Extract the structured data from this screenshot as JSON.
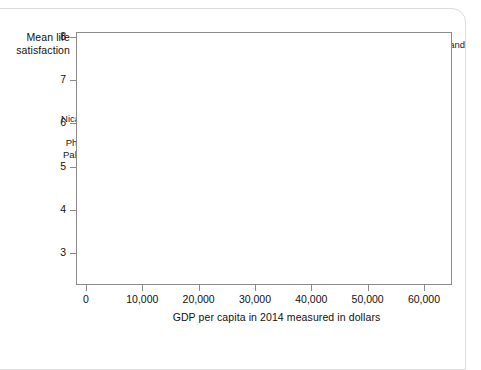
{
  "figure": {
    "y_axis_title_line1": "Mean life",
    "y_axis_title_line2": "satisfaction",
    "x_axis_title": "GDP per capita in 2014 measured in dollars"
  },
  "chart_data": {
    "type": "scatter",
    "title": "",
    "xlabel": "GDP per capita in 2014 measured in dollars",
    "ylabel": "Mean life satisfaction",
    "xlim": [
      0,
      62000
    ],
    "ylim": [
      2.6,
      8.0
    ],
    "grid": false,
    "legend": "none",
    "bubble_size_encodes": "population",
    "bubble_color": "#a6a6a6",
    "axis_color": "#8b8b8b",
    "x_ticks": [
      {
        "value": 0,
        "label": "0"
      },
      {
        "value": 10000,
        "label": "10,000"
      },
      {
        "value": 20000,
        "label": "20,000"
      },
      {
        "value": 30000,
        "label": "30,000"
      },
      {
        "value": 40000,
        "label": "40,000"
      },
      {
        "value": 50000,
        "label": "50,000"
      },
      {
        "value": 60000,
        "label": "60,000"
      }
    ],
    "y_ticks": [
      {
        "value": 3,
        "label": "3"
      },
      {
        "value": 4,
        "label": "4"
      },
      {
        "value": 5,
        "label": "5"
      },
      {
        "value": 6,
        "label": "6"
      },
      {
        "value": 7,
        "label": "7"
      },
      {
        "value": 8,
        "label": "8"
      }
    ],
    "points": [
      {
        "name": "Switzerland",
        "x": 57500,
        "y": 7.5,
        "r": 3.0,
        "labeled": true,
        "label_dx": 6,
        "label_dy": -14
      },
      {
        "name": "Canada",
        "x": 43500,
        "y": 7.3,
        "r": 6.0,
        "labeled": true,
        "label_dx": -9,
        "label_dy": -17
      },
      {
        "name": "Netherlands",
        "x": 47500,
        "y": 7.35,
        "r": 4.5,
        "labeled": true,
        "label_dx": 2,
        "label_dy": -14
      },
      {
        "name": "Finland",
        "x": 40500,
        "y": 7.4,
        "r": 3.0,
        "labeled": true,
        "label_dx": -16,
        "label_dy": -13
      },
      {
        "name": "New Zealand",
        "x": 35500,
        "y": 7.3,
        "r": 3.0,
        "labeled": true,
        "label_dx": -58,
        "label_dy": -5
      },
      {
        "name": "Israel",
        "x": 33800,
        "y": 7.1,
        "r": 3.2,
        "labeled": true,
        "label_dx": -33,
        "label_dy": 1
      },
      {
        "name": "Brazil",
        "x": 15700,
        "y": 6.95,
        "r": 10.0,
        "labeled": true,
        "label_dx": -8,
        "label_dy": -19
      },
      {
        "name": "Mexico",
        "x": 17300,
        "y": 6.8,
        "r": 9.0,
        "labeled": true,
        "label_dx": 1,
        "label_dy": -14
      },
      {
        "name": "USA",
        "x": 52500,
        "y": 7.0,
        "r": 15.0,
        "labeled": true,
        "label_dx": 9,
        "label_dy": 11
      },
      {
        "name": "UK",
        "x": 40500,
        "y": 6.9,
        "r": 8.0,
        "labeled": true,
        "label_dx": -25,
        "label_dy": -7
      },
      {
        "name": "Chile",
        "x": 22500,
        "y": 6.7,
        "r": 5.0,
        "labeled": true,
        "label_dx": 3,
        "label_dy": -11
      },
      {
        "name": "Colombia",
        "x": 13200,
        "y": 6.55,
        "r": 6.5,
        "labeled": true,
        "label_dx": -46,
        "label_dy": -6
      },
      {
        "name": "Argentina",
        "x": 22000,
        "y": 6.5,
        "r": 6.0,
        "labeled": true,
        "label_dx": -4,
        "label_dy": -2
      },
      {
        "name": "Spain",
        "x": 32500,
        "y": 6.4,
        "r": 6.5,
        "labeled": true,
        "label_dx": -6,
        "label_dy": -11
      },
      {
        "name": "Guatemala",
        "x": 7300,
        "y": 6.45,
        "r": 3.5,
        "labeled": true,
        "label_dx": -48,
        "label_dy": -7
      },
      {
        "name": "Thailand",
        "x": 15000,
        "y": 6.3,
        "r": 7.0,
        "labeled": true,
        "label_dx": -15,
        "label_dy": 1
      },
      {
        "name": "Malaysia",
        "x": 24000,
        "y": 6.3,
        "r": 5.0,
        "labeled": true,
        "label_dx": -9,
        "label_dy": 3
      },
      {
        "name": "Algeria",
        "x": 13600,
        "y": 6.1,
        "r": 4.5,
        "labeled": true,
        "label_dx": -30,
        "label_dy": 1
      },
      {
        "name": "Nicaragua",
        "x": 4800,
        "y": 6.1,
        "r": 3.0,
        "labeled": true,
        "label_dx": -52,
        "label_dy": 0
      },
      {
        "name": "France",
        "x": 37800,
        "y": 6.45,
        "r": 8.0,
        "labeled": true,
        "label_dx": -11,
        "label_dy": 12
      },
      {
        "name": "Taiwan",
        "x": 42500,
        "y": 6.35,
        "r": 6.0,
        "labeled": true,
        "label_dx": -6,
        "label_dy": 12
      },
      {
        "name": "Saudi Arabia",
        "x": 46500,
        "y": 6.4,
        "r": 5.0,
        "labeled": true,
        "label_dx": 8,
        "label_dy": 5
      },
      {
        "name": "Japan",
        "x": 36500,
        "y": 5.9,
        "r": 10.0,
        "labeled": true,
        "label_dx": -10,
        "label_dy": 16
      },
      {
        "name": "Philippines",
        "x": 6700,
        "y": 5.5,
        "r": 7.0,
        "labeled": true,
        "label_dx": -58,
        "label_dy": -2
      },
      {
        "name": "Pakistan",
        "x": 4800,
        "y": 5.3,
        "r": 7.5,
        "labeled": true,
        "label_dx": -50,
        "label_dy": 1
      },
      {
        "name": "Turkey",
        "x": 19300,
        "y": 5.3,
        "r": 7.0,
        "labeled": true,
        "label_dx": -9,
        "label_dy": 11
      },
      {
        "name": "China",
        "x": 13000,
        "y": 5.1,
        "r": 26.0,
        "labeled": true,
        "label_dx": 7,
        "label_dy": 24
      },
      {
        "name": "Greece",
        "x": 25500,
        "y": 5.0,
        "r": 3.0,
        "labeled": true,
        "label_dx": -7,
        "label_dy": 12
      },
      {
        "name": "Portugal",
        "x": 27500,
        "y": 5.05,
        "r": 3.0,
        "labeled": true,
        "label_dx": 9,
        "label_dy": 15
      },
      {
        "name": "Bulgaria",
        "x": 17500,
        "y": 4.3,
        "r": 2.5,
        "labeled": true,
        "label_dx": 6,
        "label_dy": -1
      },
      {
        "name": "Botswana",
        "x": 16500,
        "y": 4.1,
        "r": 2.5,
        "labeled": true,
        "label_dx": 4,
        "label_dy": 6
      },
      {
        "name": "Angola",
        "x": 7400,
        "y": 3.9,
        "r": 4.0,
        "labeled": true,
        "label_dx": 5,
        "label_dy": 4
      },
      {
        "name": "India",
        "x": 5600,
        "y": 4.3,
        "r": 25.0,
        "labeled": true,
        "label_dx": -2,
        "label_dy": 30
      },
      {
        "name": "Burundi",
        "x": 750,
        "y": 2.95,
        "r": 2.5,
        "labeled": true,
        "label_dx": 6,
        "label_dy": 4
      },
      {
        "name": "point-01",
        "x": 44800,
        "y": 7.45,
        "r": 2.0,
        "labeled": false
      },
      {
        "name": "point-02",
        "x": 41800,
        "y": 7.25,
        "r": 2.5,
        "labeled": false
      },
      {
        "name": "point-03",
        "x": 38500,
        "y": 7.2,
        "r": 2.5,
        "labeled": false
      },
      {
        "name": "point-04",
        "x": 45500,
        "y": 7.1,
        "r": 2.5,
        "labeled": false
      },
      {
        "name": "point-05",
        "x": 49500,
        "y": 7.15,
        "r": 2.5,
        "labeled": false
      },
      {
        "name": "point-06",
        "x": 55500,
        "y": 7.25,
        "r": 2.0,
        "labeled": false
      },
      {
        "name": "point-07",
        "x": 44000,
        "y": 6.95,
        "r": 2.5,
        "labeled": false
      },
      {
        "name": "point-08",
        "x": 46800,
        "y": 6.95,
        "r": 2.0,
        "labeled": false
      },
      {
        "name": "point-09",
        "x": 36500,
        "y": 6.95,
        "r": 2.5,
        "labeled": false
      },
      {
        "name": "point-10",
        "x": 42000,
        "y": 6.75,
        "r": 2.0,
        "labeled": false
      },
      {
        "name": "point-11",
        "x": 30000,
        "y": 6.55,
        "r": 2.5,
        "labeled": false
      },
      {
        "name": "point-12",
        "x": 28000,
        "y": 6.3,
        "r": 2.5,
        "labeled": false
      },
      {
        "name": "point-13",
        "x": 31500,
        "y": 6.1,
        "r": 2.0,
        "labeled": false
      },
      {
        "name": "point-14",
        "x": 26500,
        "y": 6.05,
        "r": 2.5,
        "labeled": false
      },
      {
        "name": "point-15",
        "x": 24800,
        "y": 5.85,
        "r": 3.5,
        "labeled": false
      },
      {
        "name": "point-16",
        "x": 21500,
        "y": 5.95,
        "r": 4.0,
        "labeled": false
      },
      {
        "name": "point-17",
        "x": 19800,
        "y": 6.05,
        "r": 3.5,
        "labeled": false
      },
      {
        "name": "point-18",
        "x": 18500,
        "y": 6.4,
        "r": 4.0,
        "labeled": false
      },
      {
        "name": "point-19",
        "x": 20500,
        "y": 6.6,
        "r": 3.0,
        "labeled": false
      },
      {
        "name": "point-20",
        "x": 12400,
        "y": 6.65,
        "r": 5.0,
        "labeled": false
      },
      {
        "name": "point-21",
        "x": 11600,
        "y": 6.35,
        "r": 5.0,
        "labeled": false
      },
      {
        "name": "point-22",
        "x": 10500,
        "y": 6.25,
        "r": 3.5,
        "labeled": false
      },
      {
        "name": "point-23",
        "x": 9700,
        "y": 6.45,
        "r": 3.0,
        "labeled": false
      },
      {
        "name": "point-24",
        "x": 8200,
        "y": 6.1,
        "r": 3.0,
        "labeled": false
      },
      {
        "name": "point-25",
        "x": 16200,
        "y": 5.75,
        "r": 4.0,
        "labeled": false
      },
      {
        "name": "point-26",
        "x": 18000,
        "y": 5.6,
        "r": 3.0,
        "labeled": false
      },
      {
        "name": "point-27",
        "x": 21000,
        "y": 5.25,
        "r": 3.0,
        "labeled": false
      },
      {
        "name": "point-28",
        "x": 23000,
        "y": 5.1,
        "r": 2.5,
        "labeled": false
      },
      {
        "name": "point-29",
        "x": 26000,
        "y": 5.35,
        "r": 2.0,
        "labeled": false
      },
      {
        "name": "point-30",
        "x": 29000,
        "y": 5.3,
        "r": 2.0,
        "labeled": false
      },
      {
        "name": "point-31",
        "x": 31500,
        "y": 5.4,
        "r": 2.0,
        "labeled": false
      },
      {
        "name": "point-32",
        "x": 24000,
        "y": 5.4,
        "r": 2.0,
        "labeled": false
      },
      {
        "name": "point-33",
        "x": 15500,
        "y": 4.95,
        "r": 3.5,
        "labeled": false
      },
      {
        "name": "point-34",
        "x": 14200,
        "y": 4.75,
        "r": 4.0,
        "labeled": false
      },
      {
        "name": "point-35",
        "x": 16000,
        "y": 4.55,
        "r": 2.5,
        "labeled": false
      },
      {
        "name": "point-36",
        "x": 12800,
        "y": 4.25,
        "r": 2.5,
        "labeled": false
      },
      {
        "name": "point-37",
        "x": 10500,
        "y": 4.55,
        "r": 5.5,
        "labeled": false
      },
      {
        "name": "point-38",
        "x": 9800,
        "y": 4.25,
        "r": 4.5,
        "labeled": false
      },
      {
        "name": "point-39",
        "x": 8700,
        "y": 4.45,
        "r": 4.0,
        "labeled": false
      },
      {
        "name": "point-40",
        "x": 3000,
        "y": 4.55,
        "r": 9.0,
        "labeled": false
      },
      {
        "name": "point-41",
        "x": 2000,
        "y": 4.35,
        "r": 6.0,
        "labeled": false
      },
      {
        "name": "point-42",
        "x": 4300,
        "y": 4.85,
        "r": 6.5,
        "labeled": false
      },
      {
        "name": "point-43",
        "x": 6000,
        "y": 5.05,
        "r": 5.0,
        "labeled": false
      },
      {
        "name": "point-44",
        "x": 3400,
        "y": 5.15,
        "r": 4.5,
        "labeled": false
      },
      {
        "name": "point-45",
        "x": 1500,
        "y": 4.05,
        "r": 4.0,
        "labeled": false
      },
      {
        "name": "point-46",
        "x": 1200,
        "y": 3.8,
        "r": 3.5,
        "labeled": false
      },
      {
        "name": "point-47",
        "x": 2200,
        "y": 3.75,
        "r": 3.0,
        "labeled": false
      },
      {
        "name": "point-48",
        "x": 3200,
        "y": 3.85,
        "r": 3.5,
        "labeled": false
      },
      {
        "name": "point-49",
        "x": 4200,
        "y": 3.7,
        "r": 3.0,
        "labeled": false
      },
      {
        "name": "point-50",
        "x": 2600,
        "y": 3.45,
        "r": 2.5,
        "labeled": false
      },
      {
        "name": "point-51",
        "x": 1800,
        "y": 3.35,
        "r": 2.0,
        "labeled": false
      },
      {
        "name": "point-52",
        "x": 5200,
        "y": 3.95,
        "r": 3.0,
        "labeled": false
      },
      {
        "name": "point-53",
        "x": 6300,
        "y": 4.1,
        "r": 3.5,
        "labeled": false
      },
      {
        "name": "point-54",
        "x": 12000,
        "y": 5.7,
        "r": 3.0,
        "labeled": false
      },
      {
        "name": "point-55",
        "x": 9000,
        "y": 5.3,
        "r": 3.0,
        "labeled": false
      },
      {
        "name": "point-56",
        "x": 7600,
        "y": 5.15,
        "r": 4.0,
        "labeled": false
      },
      {
        "name": "point-57",
        "x": 34500,
        "y": 6.6,
        "r": 2.0,
        "labeled": false
      },
      {
        "name": "point-58",
        "x": 33000,
        "y": 5.75,
        "r": 2.0,
        "labeled": false
      },
      {
        "name": "point-59",
        "x": 39500,
        "y": 5.7,
        "r": 2.0,
        "labeled": false
      },
      {
        "name": "point-60",
        "x": 27000,
        "y": 5.65,
        "r": 2.0,
        "labeled": false
      },
      {
        "name": "point-61",
        "x": 20000,
        "y": 4.85,
        "r": 2.0,
        "labeled": false
      },
      {
        "name": "point-62",
        "x": 22500,
        "y": 4.7,
        "r": 2.0,
        "labeled": false
      },
      {
        "name": "point-63",
        "x": 18800,
        "y": 4.45,
        "r": 2.0,
        "labeled": false
      },
      {
        "name": "point-64",
        "x": 13800,
        "y": 3.85,
        "r": 2.0,
        "labeled": false
      },
      {
        "name": "point-65",
        "x": 11000,
        "y": 3.95,
        "r": 2.5,
        "labeled": false
      },
      {
        "name": "point-66",
        "x": 15000,
        "y": 6.85,
        "r": 5.0,
        "labeled": false
      },
      {
        "name": "point-67",
        "x": 17000,
        "y": 7.05,
        "r": 5.0,
        "labeled": false
      },
      {
        "name": "point-68",
        "x": 25500,
        "y": 6.75,
        "r": 2.0,
        "labeled": false
      },
      {
        "name": "point-69",
        "x": 49000,
        "y": 6.6,
        "r": 2.0,
        "labeled": false
      },
      {
        "name": "point-70",
        "x": 53500,
        "y": 6.4,
        "r": 2.0,
        "labeled": false
      },
      {
        "name": "point-71",
        "x": 44500,
        "y": 6.15,
        "r": 2.0,
        "labeled": false
      },
      {
        "name": "point-72",
        "x": 35500,
        "y": 5.45,
        "r": 2.0,
        "labeled": false
      },
      {
        "name": "point-73",
        "x": 30500,
        "y": 4.95,
        "r": 2.0,
        "labeled": false
      },
      {
        "name": "point-74",
        "x": 7000,
        "y": 5.95,
        "r": 2.5,
        "labeled": false
      },
      {
        "name": "point-75",
        "x": 5500,
        "y": 5.75,
        "r": 2.0,
        "labeled": false
      }
    ]
  }
}
